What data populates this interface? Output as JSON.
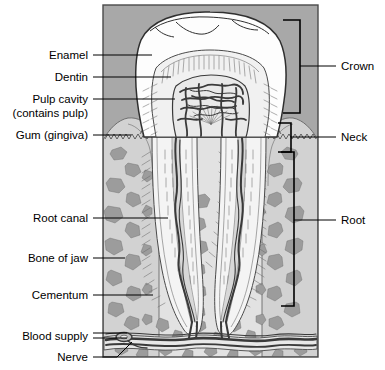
{
  "figure": {
    "background_upper_color": "#a8a8a8",
    "background_lower_color": "#e2e2e2",
    "enamel_color": "#fdfdfd",
    "dentin_color": "#f0f0f0",
    "pulp_color": "#e8e8e8",
    "bone_chip_color": "#9c9c9c",
    "gum_color": "#d4d4d4",
    "ink_color": "#2f2f2f",
    "frame_color": "#4a4a4a"
  },
  "labels_left": [
    {
      "id": "enamel",
      "text": "Enamel",
      "text2": "",
      "x": 88,
      "y": 59,
      "leader_from_x": 93,
      "leader_to_x": 152,
      "leader_y": 55
    },
    {
      "id": "dentin",
      "text": "Dentin",
      "text2": "",
      "x": 88,
      "y": 81,
      "leader_from_x": 93,
      "leader_to_x": 171,
      "leader_y": 77
    },
    {
      "id": "pulp-cavity",
      "text": "Pulp cavity",
      "text2": "(contains pulp)",
      "x": 88,
      "y": 103,
      "leader_from_x": 93,
      "leader_to_x": 175,
      "leader_y": 99
    },
    {
      "id": "gum-gingiva",
      "text": "Gum (gingiva)",
      "text2": "",
      "x": 88,
      "y": 139,
      "leader_from_x": 93,
      "leader_to_x": 131,
      "leader_y": 135
    },
    {
      "id": "root-canal",
      "text": "Root canal",
      "text2": "",
      "x": 88,
      "y": 222,
      "leader_from_x": 93,
      "leader_to_x": 168,
      "leader_y": 218
    },
    {
      "id": "bone-of-jaw",
      "text": "Bone of jaw",
      "text2": "",
      "x": 88,
      "y": 262,
      "leader_from_x": 93,
      "leader_to_x": 125,
      "leader_y": 258
    },
    {
      "id": "cementum",
      "text": "Cementum",
      "text2": "",
      "x": 88,
      "y": 299,
      "leader_from_x": 93,
      "leader_to_x": 153,
      "leader_y": 295
    },
    {
      "id": "blood-supply",
      "text": "Blood supply",
      "text2": "",
      "x": 88,
      "y": 340,
      "leader_from_x": 93,
      "leader_to_x": 127,
      "leader_y": 336
    },
    {
      "id": "nerve",
      "text": "Nerve",
      "text2": "",
      "x": 88,
      "y": 361,
      "leader_from_x": 93,
      "leader_to_x": 125,
      "leader_y": 357
    }
  ],
  "labels_right": [
    {
      "id": "crown",
      "text": "Crown",
      "x": 341,
      "y": 70,
      "leader_from_x": 300,
      "leader_to_x": 336,
      "leader_y": 66,
      "bracket_top": 20,
      "bracket_bottom": 113
    },
    {
      "id": "neck",
      "text": "Neck",
      "x": 341,
      "y": 141,
      "leader_from_x": 291,
      "leader_to_x": 336,
      "leader_y": 137,
      "bracket_top": 123,
      "bracket_bottom": 152
    },
    {
      "id": "root",
      "text": "Root",
      "x": 341,
      "y": 224,
      "leader_from_x": 294,
      "leader_to_x": 336,
      "leader_y": 220,
      "bracket_top": 152,
      "bracket_bottom": 306
    }
  ],
  "frame": {
    "x": 103,
    "y": 5,
    "width": 215,
    "height": 352
  }
}
